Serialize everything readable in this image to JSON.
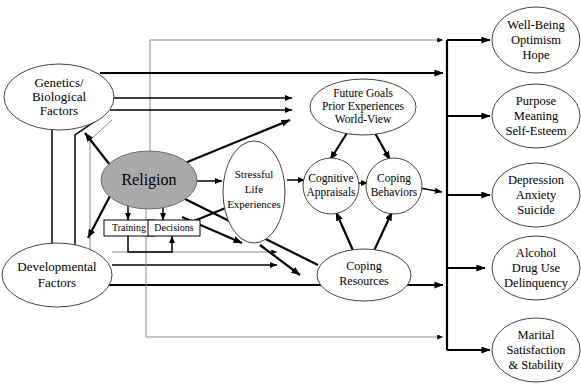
{
  "diagram": {
    "nodes": {
      "genetics": {
        "lines": [
          "Genetics/",
          "Biological",
          "Factors"
        ]
      },
      "developmental": {
        "lines": [
          "Developmental",
          "Factors"
        ]
      },
      "religion": {
        "lines": [
          "Religion"
        ],
        "fill": "#a9a9a9"
      },
      "training": {
        "label": "Training"
      },
      "decisions": {
        "label": "Decisions"
      },
      "stressful": {
        "lines": [
          "Stressful",
          "Life",
          "Experiences"
        ]
      },
      "future_goals": {
        "lines": [
          "Future Goals",
          "Prior Experiences",
          "World-View"
        ]
      },
      "cognitive": {
        "lines": [
          "Cognitive",
          "Appraisals"
        ]
      },
      "coping_behaviors": {
        "lines": [
          "Coping",
          "Behaviors"
        ]
      },
      "coping_resources": {
        "lines": [
          "Coping",
          "Resources"
        ]
      },
      "wellbeing": {
        "lines": [
          "Well-Being",
          "Optimism",
          "Hope"
        ]
      },
      "purpose": {
        "lines": [
          "Purpose",
          "Meaning",
          "Self-Esteem"
        ]
      },
      "depression": {
        "lines": [
          "Depression",
          "Anxiety",
          "Suicide"
        ]
      },
      "alcohol": {
        "lines": [
          "Alcohol",
          "Drug Use",
          "Delinquency"
        ]
      },
      "marital": {
        "lines": [
          "Marital",
          "Satisfaction",
          "& Stability"
        ]
      }
    },
    "colors": {
      "outline": "#444444",
      "shaded_fill": "#a9a9a9",
      "arrow": "#000000",
      "thin_line": "#888888"
    }
  }
}
